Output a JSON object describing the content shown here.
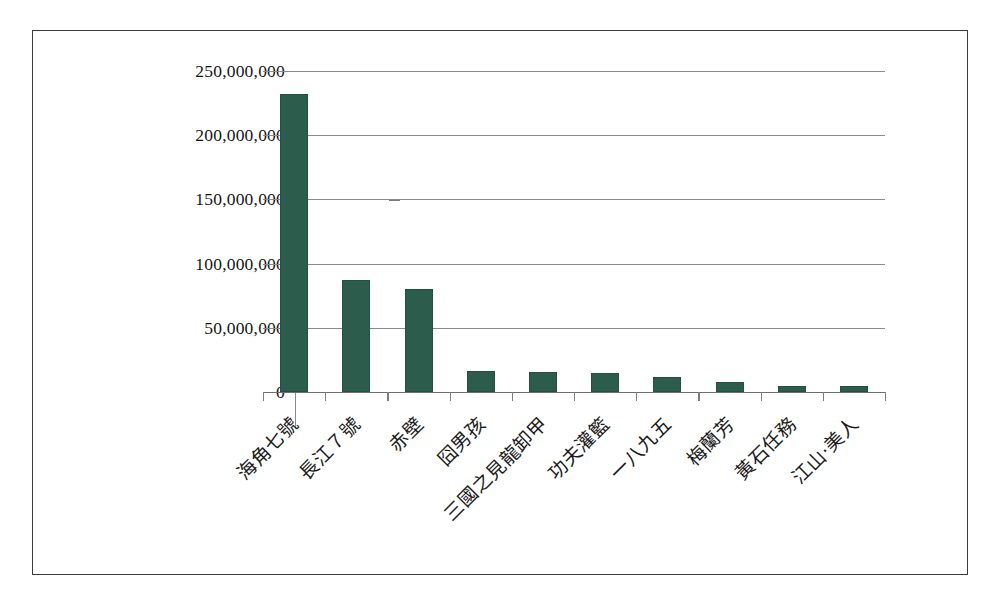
{
  "chart_data": {
    "type": "bar",
    "title": "",
    "subtitle": "",
    "xlabel": "",
    "ylabel": "",
    "grid": true,
    "legend": false,
    "legend_position": "none",
    "bar_color": "#2c5d4c",
    "categories": [
      "海角七號",
      "長江７號",
      "赤壁",
      "囧男孩",
      "三國之見龍卸甲",
      "功夫灌籃",
      "一八九五",
      "梅蘭芳",
      "黃石任務",
      "江山‧美人"
    ],
    "values": [
      232000000,
      87000000,
      80000000,
      16500000,
      15500000,
      14500000,
      11800000,
      7800000,
      4700000,
      4700000
    ],
    "ylim": [
      0,
      250000000
    ],
    "yticks": [
      0,
      50000000,
      100000000,
      150000000,
      200000000,
      250000000
    ],
    "ytick_labels": [
      "0",
      "50,000,000",
      "100,000,000",
      "150,000,000",
      "200,000,000",
      "250,000,000"
    ]
  }
}
